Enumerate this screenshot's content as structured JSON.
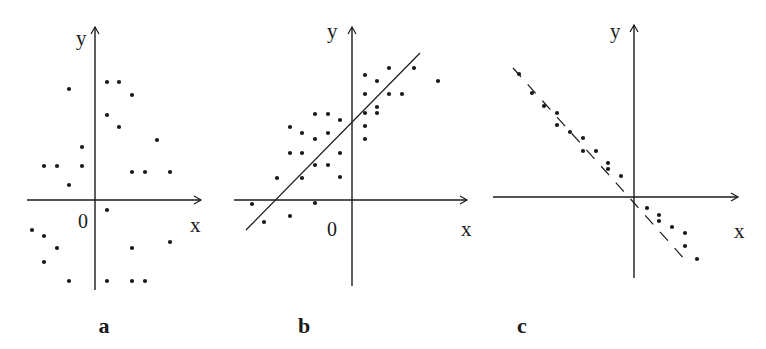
{
  "figure": {
    "background": "#ffffff",
    "ink_color": "#1a1a1a"
  },
  "chart_data": [
    {
      "type": "scatter",
      "panel_label": "a",
      "title": "",
      "xlabel": "x",
      "ylabel": "y",
      "origin_label": "0",
      "description": "No correlation",
      "grid": false,
      "regression_line": null,
      "points": [
        [
          -26,
          111
        ],
        [
          12,
          118
        ],
        [
          24,
          118
        ],
        [
          37,
          105
        ],
        [
          12,
          85
        ],
        [
          24,
          73
        ],
        [
          62,
          60
        ],
        [
          -13,
          53
        ],
        [
          -51,
          34
        ],
        [
          -38,
          34
        ],
        [
          -13,
          34
        ],
        [
          37,
          28
        ],
        [
          50,
          28
        ],
        [
          75,
          28
        ],
        [
          -26,
          15
        ],
        [
          12,
          -10
        ],
        [
          -63,
          -30
        ],
        [
          -51,
          -36
        ],
        [
          -38,
          -48
        ],
        [
          37,
          -48
        ],
        [
          75,
          -42
        ],
        [
          -51,
          -62
        ],
        [
          -26,
          -81
        ],
        [
          12,
          -81
        ],
        [
          37,
          -81
        ],
        [
          50,
          -81
        ]
      ],
      "layout": {
        "origin_px": [
          95,
          200
        ],
        "x_axis_px": [
          27,
          201
        ],
        "y_axis_px": [
          290,
          27
        ],
        "xlabel_px": [
          190,
          232
        ],
        "ylabel_px": [
          76,
          45
        ],
        "origin_label_px": [
          78,
          228
        ],
        "panel_label_px": [
          104,
          333
        ]
      }
    },
    {
      "type": "scatter",
      "panel_label": "b",
      "title": "",
      "xlabel": "x",
      "ylabel": "y",
      "origin_label": "0",
      "description": "Positive correlation",
      "grid": false,
      "regression_line": {
        "from": [
          -106,
          -30
        ],
        "to": [
          68,
          147
        ],
        "style": "solid"
      },
      "points": [
        [
          -100,
          -4
        ],
        [
          -88,
          -22
        ],
        [
          -62,
          -16
        ],
        [
          -37,
          -3
        ],
        [
          -75,
          22
        ],
        [
          -50,
          22
        ],
        [
          -12,
          23
        ],
        [
          -37,
          35
        ],
        [
          -24,
          35
        ],
        [
          -62,
          47
        ],
        [
          -50,
          47
        ],
        [
          -12,
          47
        ],
        [
          -50,
          67
        ],
        [
          -37,
          61
        ],
        [
          -24,
          67
        ],
        [
          -62,
          73
        ],
        [
          -37,
          86
        ],
        [
          -24,
          86
        ],
        [
          -12,
          80
        ],
        [
          13,
          125
        ],
        [
          25,
          119
        ],
        [
          37,
          132
        ],
        [
          62,
          132
        ],
        [
          86,
          119
        ],
        [
          13,
          106
        ],
        [
          37,
          106
        ],
        [
          50,
          106
        ],
        [
          13,
          87
        ],
        [
          25,
          93
        ],
        [
          25,
          87
        ],
        [
          13,
          74
        ],
        [
          13,
          61
        ]
      ],
      "layout": {
        "origin_px": [
          352,
          200
        ],
        "x_axis_px": [
          234,
          467
        ],
        "y_axis_px": [
          286,
          27
        ],
        "xlabel_px": [
          461,
          236
        ],
        "ylabel_px": [
          327,
          38
        ],
        "origin_label_px": [
          327,
          236
        ],
        "panel_label_px": [
          304,
          333
        ]
      }
    },
    {
      "type": "scatter",
      "panel_label": "c",
      "title": "",
      "xlabel": "x",
      "ylabel": "y",
      "origin_label": "",
      "description": "Negative correlation",
      "grid": false,
      "regression_line": {
        "from": [
          -121,
          129
        ],
        "to": [
          53,
          -65
        ],
        "style": "dashed"
      },
      "points": [
        [
          -115,
          123
        ],
        [
          -102,
          104
        ],
        [
          -90,
          91
        ],
        [
          -77,
          84
        ],
        [
          -77,
          72
        ],
        [
          -64,
          65
        ],
        [
          -51,
          59
        ],
        [
          -51,
          46
        ],
        [
          -38,
          46
        ],
        [
          -26,
          34
        ],
        [
          -26,
          28
        ],
        [
          -13,
          21
        ],
        [
          13,
          -11
        ],
        [
          25,
          -18
        ],
        [
          25,
          -24
        ],
        [
          38,
          -30
        ],
        [
          51,
          -36
        ],
        [
          51,
          -49
        ],
        [
          63,
          -62
        ]
      ],
      "layout": {
        "origin_px": [
          634,
          197
        ],
        "x_axis_px": [
          493,
          738
        ],
        "y_axis_px": [
          278,
          25
        ],
        "xlabel_px": [
          734,
          238
        ],
        "ylabel_px": [
          610,
          38
        ],
        "origin_label_px": null,
        "panel_label_px": [
          522,
          333
        ]
      }
    }
  ]
}
